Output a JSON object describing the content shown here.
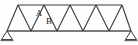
{
  "figure": {
    "name": "warren-truss-diagram",
    "width": 138,
    "height": 45,
    "background_color": "#fefefe",
    "line_color": "#3a3a3a",
    "bottom_chord_color": "#7a7a7a",
    "label_color": "#1a1a1a"
  },
  "labels": {
    "member_a": "A",
    "member_b": "B"
  },
  "geometry": {
    "top_chord": {
      "y": 5,
      "x_start": 18,
      "x_end": 122
    },
    "bottom_chord": {
      "y": 31,
      "x_start": 7,
      "x_end": 131,
      "stroke_width": 2
    },
    "top_nodes_x": [
      18,
      44,
      70,
      96,
      122
    ],
    "bottom_nodes_x": [
      7,
      31,
      57,
      83,
      109,
      131
    ],
    "diagonal_count": 10,
    "panel_count": 5
  },
  "supports": {
    "left": {
      "name": "pin-support-left",
      "apex_x": 7,
      "apex_y": 31,
      "half_width": 6,
      "height": 8,
      "ground_line": true
    },
    "right": {
      "name": "pin-support-right",
      "apex_x": 131,
      "apex_y": 31,
      "half_width": 6,
      "height": 8,
      "ground_line": true
    }
  },
  "label_positions": {
    "member_a": {
      "x": 39,
      "y": 14
    },
    "member_b": {
      "x": 49,
      "y": 22
    }
  }
}
